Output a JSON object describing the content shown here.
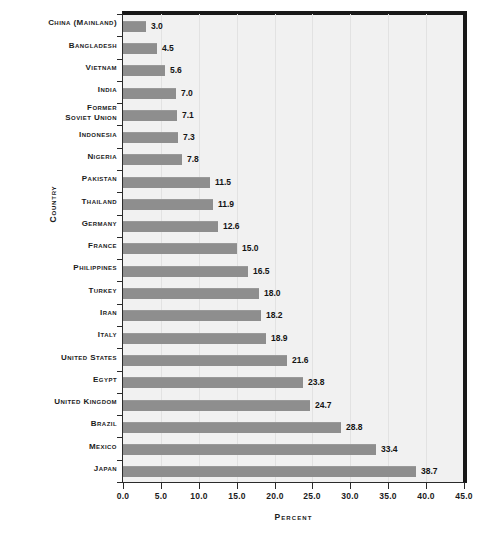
{
  "chart_data": {
    "type": "bar",
    "orientation": "horizontal",
    "title": "",
    "xlabel": "Percent",
    "ylabel": "Country",
    "xlim": [
      0.0,
      45.0
    ],
    "xticks": [
      "0.0",
      "5.0",
      "10.0",
      "15.0",
      "20.0",
      "25.0",
      "30.0",
      "35.0",
      "40.0",
      "45.0"
    ],
    "xtick_values": [
      0,
      5,
      10,
      15,
      20,
      25,
      30,
      35,
      40,
      45
    ],
    "grid": true,
    "grid_axis": "x",
    "legend": false,
    "bar_color": "#8e8e8e",
    "plot_background": "#f1f1f1",
    "categories": [
      "China (Mainland)",
      "Bangladesh",
      "Vietnam",
      "India",
      "Former\nSoviet Union",
      "Indonesia",
      "Nigeria",
      "Pakistan",
      "Thailand",
      "Germany",
      "France",
      "Philippines",
      "Turkey",
      "Iran",
      "Italy",
      "United States",
      "Egypt",
      "United Kingdom",
      "Brazil",
      "Mexico",
      "Japan"
    ],
    "values": [
      3.0,
      4.5,
      5.6,
      7.0,
      7.1,
      7.3,
      7.8,
      11.5,
      11.9,
      12.6,
      15.0,
      16.5,
      18.0,
      18.2,
      18.9,
      21.6,
      23.8,
      24.7,
      28.8,
      33.4,
      38.7
    ],
    "value_labels": [
      "3.0",
      "4.5",
      "5.6",
      "7.0",
      "7.1",
      "7.3",
      "7.8",
      "11.5",
      "11.9",
      "12.6",
      "15.0",
      "16.5",
      "18.0",
      "18.2",
      "18.9",
      "21.6",
      "23.8",
      "24.7",
      "28.8",
      "33.4",
      "38.7"
    ]
  }
}
